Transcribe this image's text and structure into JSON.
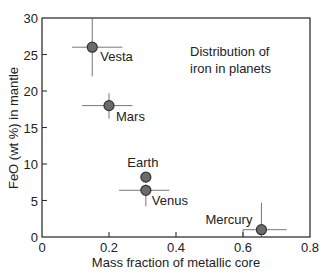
{
  "chart_data": {
    "type": "scatter",
    "title": "",
    "annotation": [
      "Distribution of",
      "iron in planets"
    ],
    "xlabel": "Mass fraction of metallic core",
    "ylabel": "FeO (wt %) in mantle",
    "xlim": [
      0,
      0.8
    ],
    "ylim": [
      0,
      30
    ],
    "xticks": [
      0,
      0.2,
      0.4,
      0.6,
      0.8
    ],
    "xtick_labels": [
      "0",
      "0.2",
      "0.4",
      "0.6",
      "0.8"
    ],
    "yticks": [
      0,
      5,
      10,
      15,
      20,
      25,
      30
    ],
    "ytick_labels": [
      "0",
      "5",
      "10",
      "15",
      "20",
      "25",
      "30"
    ],
    "grid": false,
    "legend": null,
    "colors": {
      "marker_fill": "#6b6b6b",
      "marker_stroke": "#333333",
      "errorbar": "#777777",
      "axis": "#333333"
    },
    "series": [
      {
        "name": "Planets",
        "points": [
          {
            "label": "Vesta",
            "x": 0.15,
            "y": 26.0,
            "xerr": [
              0.09,
              0.24
            ],
            "yerr": [
              22.0,
              30.0
            ]
          },
          {
            "label": "Mars",
            "x": 0.2,
            "y": 18.0,
            "xerr": [
              0.12,
              0.27
            ],
            "yerr": [
              16.2,
              19.7
            ]
          },
          {
            "label": "Earth",
            "x": 0.31,
            "y": 8.2,
            "xerr": null,
            "yerr": null
          },
          {
            "label": "Venus",
            "x": 0.31,
            "y": 6.4,
            "xerr": [
              0.23,
              0.38
            ],
            "yerr": [
              4.2,
              7.2
            ]
          },
          {
            "label": "Mercury",
            "x": 0.655,
            "y": 1.0,
            "xerr": [
              0.6,
              0.73
            ],
            "yerr": [
              0.0,
              4.7
            ]
          }
        ]
      }
    ]
  }
}
